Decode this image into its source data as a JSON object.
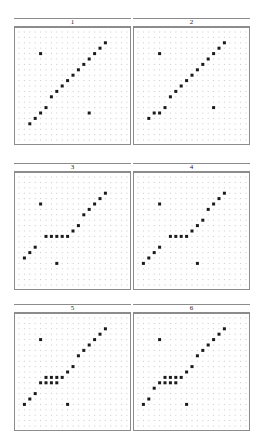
{
  "figure": {
    "type": "trellis-scatter-matrix",
    "panel_count": 6,
    "rows": 3,
    "cols": 2,
    "background": "#ffffff",
    "grid_dot_color": "#c8c8c8",
    "point_color": "#1a1a1a",
    "border_color": "#8c8c8c"
  },
  "layout": {
    "canvas_width": 266,
    "canvas_height": 437,
    "panel_width": 117,
    "panel_height": 118,
    "strip_height": 9,
    "col_x": [
      14,
      133
    ],
    "row_y": [
      18,
      163,
      304
    ],
    "grid_cols": 21,
    "grid_rows": 21,
    "grid_step": 5.4,
    "grid_origin": [
      4,
      4
    ]
  },
  "chart_data": {
    "type": "scatter",
    "title": "",
    "xlabel": "",
    "ylabel": "",
    "xlim": [
      0,
      20
    ],
    "ylim": [
      0,
      20
    ],
    "grid": true,
    "legend": "none",
    "note": "Six lattice panels of grid-dot backgrounds with dark scatter points; x,y are 0-20 grid-index coordinates with y measured upward.",
    "panels": [
      {
        "label": "1",
        "points": [
          {
            "x": 2,
            "y": 3
          },
          {
            "x": 3,
            "y": 4
          },
          {
            "x": 4,
            "y": 5
          },
          {
            "x": 5,
            "y": 6
          },
          {
            "x": 6,
            "y": 8
          },
          {
            "x": 7,
            "y": 9
          },
          {
            "x": 8,
            "y": 10
          },
          {
            "x": 9,
            "y": 11
          },
          {
            "x": 10,
            "y": 12
          },
          {
            "x": 11,
            "y": 13
          },
          {
            "x": 12,
            "y": 14
          },
          {
            "x": 13,
            "y": 15
          },
          {
            "x": 14,
            "y": 16
          },
          {
            "x": 15,
            "y": 17
          },
          {
            "x": 16,
            "y": 18
          },
          {
            "x": 4,
            "y": 16
          },
          {
            "x": 13,
            "y": 5
          }
        ]
      },
      {
        "label": "2",
        "points": [
          {
            "x": 2,
            "y": 4
          },
          {
            "x": 3,
            "y": 5
          },
          {
            "x": 4,
            "y": 5
          },
          {
            "x": 5,
            "y": 6
          },
          {
            "x": 6,
            "y": 8
          },
          {
            "x": 7,
            "y": 9
          },
          {
            "x": 8,
            "y": 10
          },
          {
            "x": 9,
            "y": 11
          },
          {
            "x": 10,
            "y": 12
          },
          {
            "x": 11,
            "y": 13
          },
          {
            "x": 12,
            "y": 14
          },
          {
            "x": 13,
            "y": 15
          },
          {
            "x": 14,
            "y": 16
          },
          {
            "x": 15,
            "y": 17
          },
          {
            "x": 16,
            "y": 18
          },
          {
            "x": 4,
            "y": 16
          },
          {
            "x": 14,
            "y": 6
          }
        ]
      },
      {
        "label": "3",
        "points": [
          {
            "x": 1,
            "y": 5
          },
          {
            "x": 2,
            "y": 6
          },
          {
            "x": 3,
            "y": 7
          },
          {
            "x": 5,
            "y": 9
          },
          {
            "x": 6,
            "y": 9
          },
          {
            "x": 7,
            "y": 9
          },
          {
            "x": 8,
            "y": 9
          },
          {
            "x": 9,
            "y": 9
          },
          {
            "x": 10,
            "y": 10
          },
          {
            "x": 11,
            "y": 11
          },
          {
            "x": 12,
            "y": 13
          },
          {
            "x": 13,
            "y": 14
          },
          {
            "x": 14,
            "y": 15
          },
          {
            "x": 15,
            "y": 16
          },
          {
            "x": 16,
            "y": 17
          },
          {
            "x": 4,
            "y": 15
          },
          {
            "x": 7,
            "y": 4
          }
        ]
      },
      {
        "label": "4",
        "points": [
          {
            "x": 1,
            "y": 4
          },
          {
            "x": 2,
            "y": 5
          },
          {
            "x": 3,
            "y": 6
          },
          {
            "x": 4,
            "y": 7
          },
          {
            "x": 6,
            "y": 9
          },
          {
            "x": 7,
            "y": 9
          },
          {
            "x": 8,
            "y": 9
          },
          {
            "x": 9,
            "y": 9
          },
          {
            "x": 10,
            "y": 10
          },
          {
            "x": 11,
            "y": 11
          },
          {
            "x": 12,
            "y": 12
          },
          {
            "x": 13,
            "y": 14
          },
          {
            "x": 14,
            "y": 15
          },
          {
            "x": 15,
            "y": 16
          },
          {
            "x": 16,
            "y": 17
          },
          {
            "x": 4,
            "y": 15
          },
          {
            "x": 11,
            "y": 4
          }
        ]
      },
      {
        "label": "5",
        "points": [
          {
            "x": 1,
            "y": 4
          },
          {
            "x": 2,
            "y": 5
          },
          {
            "x": 3,
            "y": 6
          },
          {
            "x": 4,
            "y": 8
          },
          {
            "x": 5,
            "y": 8
          },
          {
            "x": 5,
            "y": 9
          },
          {
            "x": 6,
            "y": 9
          },
          {
            "x": 6,
            "y": 8
          },
          {
            "x": 7,
            "y": 9
          },
          {
            "x": 7,
            "y": 8
          },
          {
            "x": 8,
            "y": 9
          },
          {
            "x": 9,
            "y": 10
          },
          {
            "x": 10,
            "y": 11
          },
          {
            "x": 11,
            "y": 13
          },
          {
            "x": 12,
            "y": 14
          },
          {
            "x": 13,
            "y": 15
          },
          {
            "x": 14,
            "y": 16
          },
          {
            "x": 15,
            "y": 17
          },
          {
            "x": 16,
            "y": 18
          },
          {
            "x": 4,
            "y": 16
          },
          {
            "x": 9,
            "y": 4
          }
        ]
      },
      {
        "label": "6",
        "points": [
          {
            "x": 1,
            "y": 4
          },
          {
            "x": 2,
            "y": 5
          },
          {
            "x": 3,
            "y": 7
          },
          {
            "x": 4,
            "y": 8
          },
          {
            "x": 5,
            "y": 8
          },
          {
            "x": 5,
            "y": 9
          },
          {
            "x": 6,
            "y": 9
          },
          {
            "x": 6,
            "y": 8
          },
          {
            "x": 7,
            "y": 9
          },
          {
            "x": 7,
            "y": 8
          },
          {
            "x": 8,
            "y": 9
          },
          {
            "x": 9,
            "y": 10
          },
          {
            "x": 10,
            "y": 11
          },
          {
            "x": 11,
            "y": 13
          },
          {
            "x": 12,
            "y": 14
          },
          {
            "x": 13,
            "y": 15
          },
          {
            "x": 14,
            "y": 16
          },
          {
            "x": 15,
            "y": 17
          },
          {
            "x": 16,
            "y": 18
          },
          {
            "x": 4,
            "y": 16
          },
          {
            "x": 9,
            "y": 4
          }
        ]
      }
    ]
  }
}
